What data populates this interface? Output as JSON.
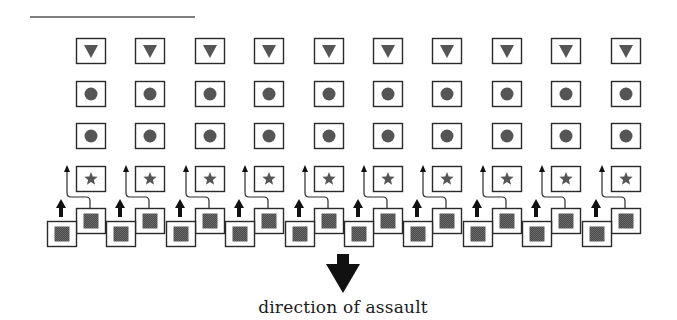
{
  "diagram": {
    "caption": "direction of assault",
    "colors": {
      "stroke": "#2a2a2a",
      "fill": "#ffffff",
      "symbol": "#555555",
      "arrow": "#111111",
      "rule": "#555555"
    },
    "top_rule": {
      "x1": 30,
      "x2": 195,
      "y": 17
    },
    "columns": 10,
    "first_column_x": 76,
    "column_spacing": 59.4,
    "box_width": 29,
    "box_height": 25,
    "rows": [
      {
        "name": "triangle-row",
        "symbol": "triangle-down",
        "y": 38
      },
      {
        "name": "circle-row-1",
        "symbol": "circle",
        "y": 81
      },
      {
        "name": "circle-row-2",
        "symbol": "circle",
        "y": 123
      },
      {
        "name": "star-row",
        "symbol": "star",
        "y": 166
      }
    ],
    "front_line": {
      "upper_box_y": 208,
      "lower_box_y": 221,
      "symbol": "square"
    },
    "assault_arrow": {
      "x": 343,
      "top": 254,
      "tip": 293
    }
  }
}
